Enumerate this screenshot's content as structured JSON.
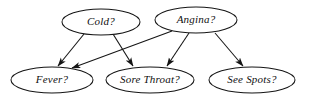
{
  "diagram": {
    "type": "bayesian-network",
    "background_color": "#ffffff",
    "stroke_color": "#151515",
    "text_color": "#101010",
    "nodes": [
      {
        "id": "cold",
        "label": "Cold?",
        "cx": 101,
        "cy": 22,
        "rx": 39,
        "ry": 13,
        "layer": "top"
      },
      {
        "id": "angina",
        "label": "Angina?",
        "cx": 196,
        "cy": 20,
        "rx": 41,
        "ry": 13,
        "layer": "top"
      },
      {
        "id": "fever",
        "label": "Fever?",
        "cx": 52,
        "cy": 80,
        "rx": 41,
        "ry": 13,
        "layer": "bottom"
      },
      {
        "id": "sore_throat",
        "label": "Sore Throat?",
        "cx": 150,
        "cy": 80,
        "rx": 44,
        "ry": 13,
        "layer": "bottom"
      },
      {
        "id": "see_spots",
        "label": "See Spots?",
        "cx": 252,
        "cy": 80,
        "rx": 43,
        "ry": 13,
        "layer": "bottom"
      }
    ],
    "edges": [
      {
        "id": "cold-fever",
        "from": "cold",
        "to": "fever",
        "x1": 84,
        "y1": 34,
        "x2": 58,
        "y2": 66,
        "directed": true
      },
      {
        "id": "cold-sore-throat",
        "from": "cold",
        "to": "sore_throat",
        "x1": 113,
        "y1": 34,
        "x2": 133,
        "y2": 66,
        "directed": true
      },
      {
        "id": "angina-fever",
        "from": "angina",
        "to": "fever",
        "x1": 172,
        "y1": 31,
        "x2": 72,
        "y2": 68,
        "directed": true
      },
      {
        "id": "angina-sore-throat",
        "from": "angina",
        "to": "sore_throat",
        "x1": 189,
        "y1": 33,
        "x2": 167,
        "y2": 66,
        "directed": true
      },
      {
        "id": "angina-see-spots",
        "from": "angina",
        "to": "see_spots",
        "x1": 215,
        "y1": 33,
        "x2": 243,
        "y2": 66,
        "directed": true
      }
    ]
  }
}
